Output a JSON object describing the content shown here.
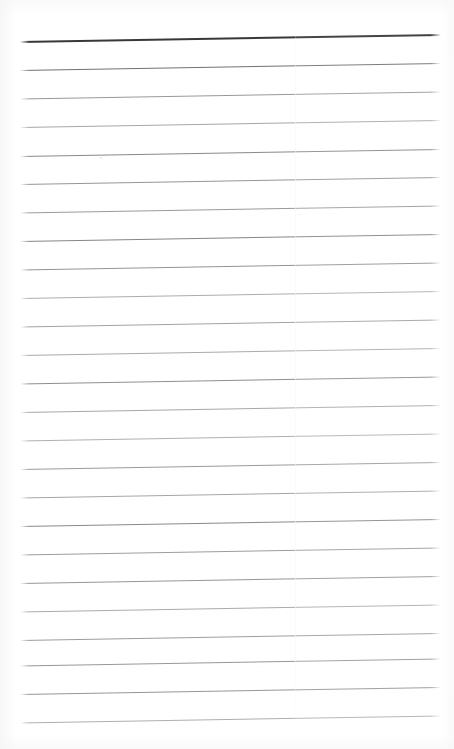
{
  "document": {
    "kind": "scanned-lined-paper",
    "title": "Blank Ruled Notebook Page",
    "page_width": 454,
    "page_height": 749,
    "background_color": "#ffffff",
    "orientation": "portrait",
    "content_text": "",
    "handwriting_present": "no",
    "printed_text_present": "no"
  },
  "ruling": {
    "line_count": 25,
    "first_line_y": 41,
    "line_spacing": 28.4,
    "left_margin_x": 20,
    "right_margin_x": 441,
    "slope_rise_px": -7,
    "line_thickness_px": 1,
    "header_rule_index": 0,
    "header_rule_color": "#3a3a3a",
    "header_rule_thickness_px": 2,
    "body_rule_color_dark": "#6e6e6e",
    "body_rule_color_light": "#b9b9b9",
    "lines": [
      {
        "index": 1,
        "y_left": 41.0,
        "color": "#383838",
        "thickness": 2.0,
        "opacity": 1.0
      },
      {
        "index": 2,
        "y_left": 70.0,
        "color": "#6a6a6a",
        "thickness": 1.0,
        "opacity": 0.95
      },
      {
        "index": 3,
        "y_left": 98.5,
        "color": "#8d8d8d",
        "thickness": 1.0,
        "opacity": 0.9
      },
      {
        "index": 4,
        "y_left": 127.0,
        "color": "#9a9a9a",
        "thickness": 1.0,
        "opacity": 0.88
      },
      {
        "index": 5,
        "y_left": 156.0,
        "color": "#7e7e7e",
        "thickness": 1.0,
        "opacity": 0.92
      },
      {
        "index": 6,
        "y_left": 184.0,
        "color": "#8a8a8a",
        "thickness": 1.0,
        "opacity": 0.9
      },
      {
        "index": 7,
        "y_left": 212.5,
        "color": "#8f8f8f",
        "thickness": 1.0,
        "opacity": 0.9
      },
      {
        "index": 8,
        "y_left": 241.0,
        "color": "#7c7c7c",
        "thickness": 1.0,
        "opacity": 0.93
      },
      {
        "index": 9,
        "y_left": 269.5,
        "color": "#888888",
        "thickness": 1.0,
        "opacity": 0.9
      },
      {
        "index": 10,
        "y_left": 298.0,
        "color": "#9e9e9e",
        "thickness": 1.0,
        "opacity": 0.86
      },
      {
        "index": 11,
        "y_left": 326.5,
        "color": "#959595",
        "thickness": 1.0,
        "opacity": 0.88
      },
      {
        "index": 12,
        "y_left": 355.0,
        "color": "#9c9c9c",
        "thickness": 1.0,
        "opacity": 0.86
      },
      {
        "index": 13,
        "y_left": 383.5,
        "color": "#848484",
        "thickness": 1.0,
        "opacity": 0.91
      },
      {
        "index": 14,
        "y_left": 412.0,
        "color": "#9a9a9a",
        "thickness": 1.0,
        "opacity": 0.87
      },
      {
        "index": 15,
        "y_left": 440.5,
        "color": "#a2a2a2",
        "thickness": 1.0,
        "opacity": 0.85
      },
      {
        "index": 16,
        "y_left": 469.0,
        "color": "#8e8e8e",
        "thickness": 1.0,
        "opacity": 0.89
      },
      {
        "index": 17,
        "y_left": 497.5,
        "color": "#989898",
        "thickness": 1.0,
        "opacity": 0.87
      },
      {
        "index": 18,
        "y_left": 526.0,
        "color": "#7f7f7f",
        "thickness": 1.0,
        "opacity": 0.92
      },
      {
        "index": 19,
        "y_left": 554.5,
        "color": "#909090",
        "thickness": 1.0,
        "opacity": 0.89
      },
      {
        "index": 20,
        "y_left": 583.0,
        "color": "#8a8a8a",
        "thickness": 1.0,
        "opacity": 0.9
      },
      {
        "index": 21,
        "y_left": 611.5,
        "color": "#9d9d9d",
        "thickness": 1.0,
        "opacity": 0.86
      },
      {
        "index": 22,
        "y_left": 640.0,
        "color": "#909090",
        "thickness": 1.0,
        "opacity": 0.89
      },
      {
        "index": 23,
        "y_left": 665.5,
        "color": "#8c8c8c",
        "thickness": 1.0,
        "opacity": 0.9
      },
      {
        "index": 24,
        "y_left": 694.0,
        "color": "#8a8a8a",
        "thickness": 1.0,
        "opacity": 0.9
      },
      {
        "index": 25,
        "y_left": 722.5,
        "color": "#a0a0a0",
        "thickness": 1.0,
        "opacity": 0.85
      }
    ]
  },
  "scan_artifacts": {
    "seam_x": 295,
    "seam_description": "faint vertical scanner seam",
    "specks": [
      {
        "x": 100,
        "y": 157,
        "size": 2
      },
      {
        "x": 300,
        "y": 214,
        "size": 1
      },
      {
        "x": 258,
        "y": 666,
        "size": 1
      }
    ]
  }
}
